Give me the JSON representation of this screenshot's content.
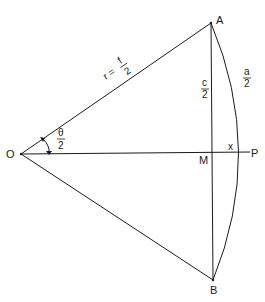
{
  "diagram": {
    "points": {
      "O": {
        "label": "O",
        "x": 21,
        "y": 154
      },
      "A": {
        "label": "A",
        "x": 211,
        "y": 23
      },
      "B": {
        "label": "B",
        "x": 213,
        "y": 280
      },
      "M": {
        "label": "M",
        "x": 212,
        "y": 153
      },
      "P": {
        "label": "P",
        "x": 250,
        "y": 152
      }
    },
    "labels": {
      "radius_lhs": "r =",
      "radius_num": "f",
      "radius_den": "2",
      "half_chord_num": "c",
      "half_chord_den": "2",
      "half_arc_num": "a",
      "half_arc_den": "2",
      "half_angle_num": "θ",
      "half_angle_den": "2",
      "sagitta": "x"
    },
    "edges": [
      {
        "from": "O",
        "to": "A",
        "label": "r = f/2"
      },
      {
        "from": "O",
        "to": "B"
      },
      {
        "from": "O",
        "to": "P"
      },
      {
        "from": "A",
        "to": "B",
        "label": "c/2 (upper half)"
      },
      {
        "from": "A",
        "to": "B",
        "type": "arc",
        "label": "a/2 (upper half)"
      }
    ],
    "colors": {
      "line": "#1a1a1a",
      "background": "#ffffff"
    }
  }
}
